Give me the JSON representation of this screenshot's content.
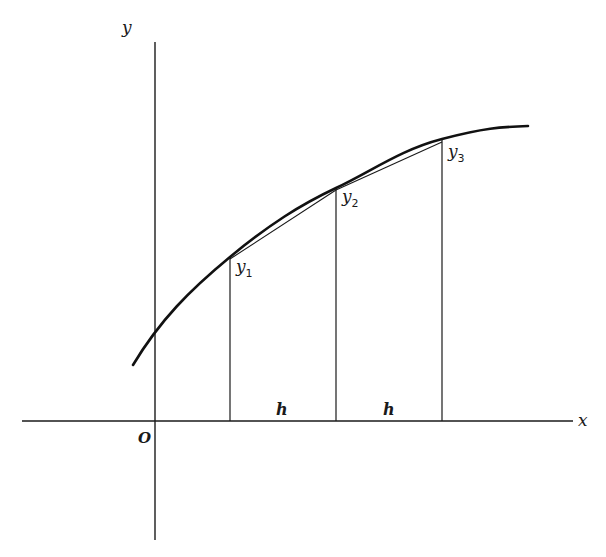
{
  "diagram": {
    "type": "trapezoidal-rule-figure",
    "axes": {
      "x_label": "x",
      "y_label": "y",
      "origin_label": "O"
    },
    "ordinates": [
      {
        "name": "y",
        "sub": "1"
      },
      {
        "name": "y",
        "sub": "2"
      },
      {
        "name": "y",
        "sub": "3"
      }
    ],
    "intervals": [
      "h",
      "h"
    ],
    "colors": {
      "ink": "#1a1a1a",
      "background": "#ffffff"
    }
  }
}
